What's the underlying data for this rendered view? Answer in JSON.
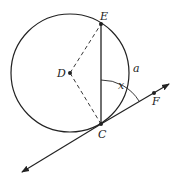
{
  "diagram": {
    "points": {
      "E": {
        "label": "E"
      },
      "D": {
        "label": "D"
      },
      "C": {
        "label": "C"
      },
      "F": {
        "label": "F"
      }
    },
    "arc_label": "a",
    "angle_label": "x",
    "stroke_color": "#222222"
  }
}
